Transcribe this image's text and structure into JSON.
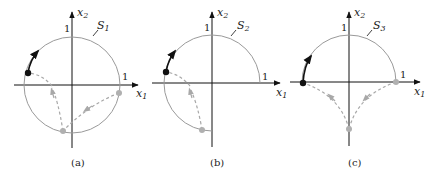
{
  "figure": {
    "panels": [
      {
        "id": "a",
        "caption": "(a)",
        "set_label": "S",
        "set_sub": "1",
        "x_axis_label": "x",
        "x_axis_sub": "1",
        "y_axis_label": "x",
        "y_axis_sub": "2",
        "tick_x": "1",
        "tick_y": "1",
        "curve": "full circle of radius 1"
      },
      {
        "id": "b",
        "caption": "(b)",
        "set_label": "S",
        "set_sub": "2",
        "x_axis_label": "x",
        "x_axis_sub": "1",
        "y_axis_label": "x",
        "y_axis_sub": "2",
        "tick_x": "1",
        "tick_y": "1",
        "curve": "three-quarter circle (missing fourth quadrant)"
      },
      {
        "id": "c",
        "caption": "(c)",
        "set_label": "S",
        "set_sub": "3",
        "x_axis_label": "x",
        "x_axis_sub": "1",
        "y_axis_label": "x",
        "y_axis_sub": "2",
        "tick_x": "1",
        "tick_y": "1",
        "curve": "upper semicircle"
      }
    ],
    "colors": {
      "axis": "#111111",
      "circle": "#9a9a9a",
      "dashed_path": "#a8a8a8",
      "start_point": "#b0b0b0",
      "end_point": "#111111",
      "solid_arrow": "#111111"
    }
  }
}
